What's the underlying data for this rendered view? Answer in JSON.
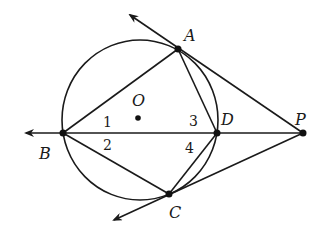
{
  "figure": {
    "type": "geometry",
    "points": {
      "A": {
        "label": "A",
        "x": 178,
        "y": 49
      },
      "B": {
        "label": "B",
        "x": 63,
        "y": 133
      },
      "C": {
        "label": "C",
        "x": 169,
        "y": 194
      },
      "D": {
        "label": "D",
        "x": 217,
        "y": 133
      },
      "P": {
        "label": "P",
        "x": 303,
        "y": 133
      },
      "O": {
        "label": "O",
        "x": 138,
        "y": 118
      }
    },
    "angle_labels": [
      "1",
      "2",
      "3",
      "4"
    ],
    "colors": {
      "ink": "#1a1a1a",
      "background": "#ffffff"
    }
  }
}
